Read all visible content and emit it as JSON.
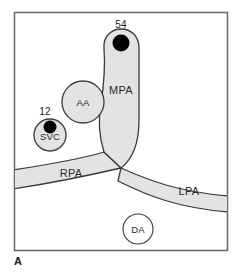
{
  "figure": {
    "panel_letter": "A",
    "frame_color": "#6e6e6e",
    "vessel_fill": "#e3e3e3",
    "vessel_stroke": "#3a3a3a",
    "marker_color": "#000000",
    "background": "#ffffff"
  },
  "structures": {
    "mpa": {
      "label": "MPA",
      "name": "main-pulmonary-artery"
    },
    "rpa": {
      "label": "RPA",
      "name": "right-pulmonary-artery"
    },
    "lpa": {
      "label": "LPA",
      "name": "left-pulmonary-artery"
    },
    "aa": {
      "label": "AA",
      "name": "ascending-aorta"
    },
    "svc": {
      "label": "SVC",
      "name": "superior-vena-cava"
    },
    "da": {
      "label": "DA",
      "name": "descending-aorta"
    }
  },
  "measurements": [
    {
      "value": "54",
      "site": "MPA",
      "marker": "filled-dot"
    },
    {
      "value": "12",
      "site": "SVC",
      "marker": "filled-dot"
    }
  ]
}
